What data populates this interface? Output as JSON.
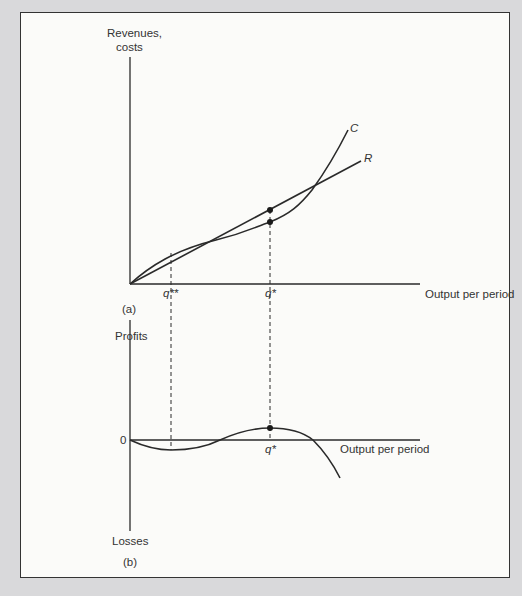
{
  "panel_a": {
    "y_axis_label_line1": "Revenues,",
    "y_axis_label_line2": "costs",
    "x_axis_label": "Output per period",
    "tick_q_double_star": "q**",
    "tick_q_star": "q*",
    "curve_labels": {
      "cost": "C",
      "revenue": "R"
    },
    "panel_label": "(a)"
  },
  "panel_b": {
    "y_axis_top_label": "Profits",
    "y_axis_bottom_label": "Losses",
    "zero_label": "0",
    "x_axis_label": "Output per period",
    "tick_q_star": "q*",
    "panel_label": "(b)"
  },
  "colors": {
    "line": "#2a2a2a",
    "background": "#fbfbf9",
    "page": "#d9d9db"
  }
}
